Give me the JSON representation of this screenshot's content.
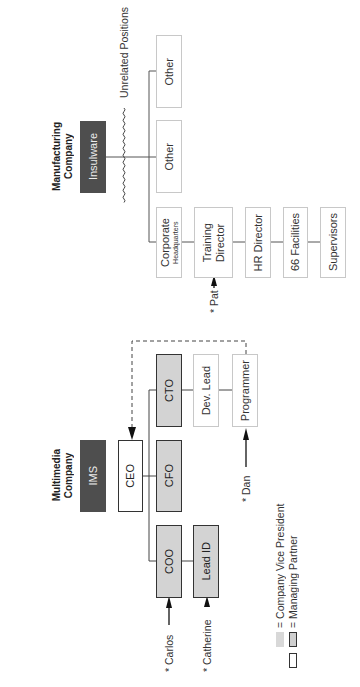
{
  "manufacturing": {
    "title_line1": "Manufacturing",
    "title_line2": "Company",
    "company_box": "Insulware",
    "unrelated_label": "Unrelated Positions",
    "other_boxes": [
      "Other",
      "Other"
    ],
    "chain": [
      {
        "line1": "Corporate",
        "line2": "Headquarters"
      },
      {
        "line1": "Training",
        "line2": "Director"
      },
      {
        "line1": "HR Director"
      },
      {
        "line1": "66 Facilities"
      },
      {
        "line1": "Supervisors"
      }
    ],
    "person": {
      "label": "* Pat",
      "points_to": "Training Director"
    }
  },
  "multimedia": {
    "title_line1": "Multimedia",
    "title_line2": "Company",
    "company_box": "IMS",
    "ceo": "CEO",
    "vps": {
      "cto": "CTO",
      "cfo": "CFO",
      "coo": "COO"
    },
    "cto_chain": [
      "Dev. Lead",
      "Programmer"
    ],
    "coo_chain": [
      "Lead ID"
    ],
    "people": [
      {
        "label": "* Dan",
        "points_to": "Programmer"
      },
      {
        "label": "* Carlos",
        "points_to": "COO"
      },
      {
        "label": "* Catherine",
        "points_to": "Lead ID"
      }
    ]
  },
  "legend": [
    {
      "swatch": "light-gray",
      "label": "= Company Vice President"
    },
    {
      "swatch": "white-and-gray-bordered",
      "label": "= Managing Partner"
    }
  ],
  "colors": {
    "company_box": "#4e4e4e",
    "vp_fill": "#d3d3d3",
    "strong_border": "#333333",
    "light_border": "#c8c8c8",
    "legend_light": "#d8d8d8"
  }
}
